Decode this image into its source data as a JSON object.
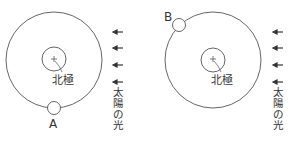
{
  "diagrams": [
    {
      "id": "left",
      "pole_label": "北極",
      "satellite_label": "A",
      "sunlight_label": [
        "太",
        "陽",
        "の",
        "光"
      ]
    },
    {
      "id": "right",
      "pole_label": "北極",
      "satellite_label": "B",
      "sunlight_label": [
        "太",
        "陽",
        "の",
        "光"
      ]
    }
  ],
  "colors": {
    "line": "#555555",
    "text": "#333333"
  }
}
